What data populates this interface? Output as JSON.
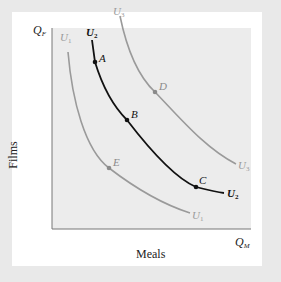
{
  "diagram": {
    "type": "indifference-curves",
    "axes": {
      "y_axis_symbol": "Q",
      "y_axis_subscript": "F",
      "x_axis_symbol": "Q",
      "x_axis_subscript": "M",
      "y_axis_label": "Films",
      "x_axis_label": "Meals"
    },
    "curves": [
      {
        "name": "U1",
        "symbol": "U",
        "subscript": "1",
        "color": "#9a9a9a",
        "emphasis": "light"
      },
      {
        "name": "U2",
        "symbol": "U",
        "subscript": "2",
        "color": "#111111",
        "emphasis": "bold"
      },
      {
        "name": "U3",
        "symbol": "U",
        "subscript": "3",
        "color": "#9a9a9a",
        "emphasis": "light"
      }
    ],
    "points": [
      {
        "label": "A",
        "curve": "U2"
      },
      {
        "label": "B",
        "curve": "U2"
      },
      {
        "label": "C",
        "curve": "U2"
      },
      {
        "label": "D",
        "curve": "U3"
      },
      {
        "label": "E",
        "curve": "U1"
      }
    ],
    "colors": {
      "plot_background": "#ececec",
      "frame_background": "#e9e9e9",
      "panel_background": "#ffffff",
      "highlight_curve": "#111111",
      "other_curves": "#9a9a9a"
    }
  }
}
